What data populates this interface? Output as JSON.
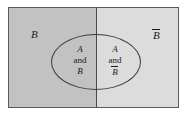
{
  "diagram": {
    "type": "venn-diagram",
    "colors": {
      "region_b_fill": "#c2c2c2",
      "region_b_complement_fill": "#dcdcdc",
      "outline": "#5a5a5a",
      "ellipse_outline": "#3c3c3c",
      "divider": "#4a4a4a",
      "text": "#1a1a1a",
      "page_background": "#ffffff"
    },
    "labels": {
      "region_b": "B",
      "region_b_complement_base": "B",
      "region_b_complement_overbar": true
    },
    "ellipse": {
      "set_name": "A",
      "left_half": {
        "line1": "A",
        "line2": "and",
        "line3_base": "B",
        "line3_overbar": false
      },
      "right_half": {
        "line1": "A",
        "line2": "and",
        "line3_base": "B",
        "line3_overbar": true
      }
    }
  }
}
